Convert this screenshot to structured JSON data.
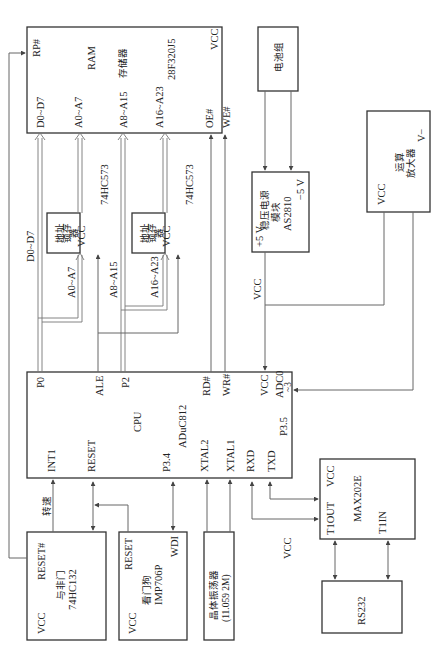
{
  "diagram": {
    "type": "block-diagram",
    "orientation": "rotated-90-ccw",
    "blocks": {
      "ram": {
        "pins": {
          "rp": "RP#",
          "d": "D0~D7",
          "a_lo": "A0~A7",
          "a_mid": "A8~A15",
          "a_hi": "A16~A23",
          "oe": "OE#",
          "we": "WE#",
          "vcc": "VCC"
        },
        "title": "RAM",
        "subtitle": "存储器",
        "part": "28F320J5"
      },
      "battery": {
        "title": "电池组"
      },
      "regulator": {
        "line1": "稳压电源",
        "line2": "模块",
        "part": "AS2810",
        "pos": "+5 V",
        "neg": "−5 V"
      },
      "opamp": {
        "line1": "运算",
        "line2": "放大器",
        "vcc": "VCC",
        "vminus": "V−"
      },
      "latch1": {
        "line1": "地址",
        "line2": "锁存",
        "line3": "器",
        "vcc": "VCC",
        "part": "74HC573"
      },
      "latch2": {
        "line1": "地址",
        "line2": "锁存",
        "line3": "器",
        "vcc": "VCC",
        "part": "74HC573"
      },
      "cpu": {
        "pins": {
          "p0": "P0",
          "ale": "ALE",
          "p2": "P2",
          "rd": "RD#",
          "wr": "WR#",
          "vcc": "VCC",
          "adc": "ADC0",
          "adc2": "~3",
          "p35": "P3.5",
          "int1": "INT1",
          "reset": "RESET",
          "p34": "P3.4",
          "xtal2": "XTAL2",
          "xtal1": "XTAL1",
          "rxd": "RXD",
          "txd": "TXD"
        },
        "title": "CPU",
        "part": "ADuC812"
      },
      "nand": {
        "reset": "RESET#",
        "line1": "与非门",
        "part": "74HC132",
        "vcc": "VCC"
      },
      "watchdog": {
        "reset": "RESET",
        "wdi": "WDI",
        "line1": "看门狗",
        "part": "IMP706P",
        "vcc": "VCC"
      },
      "crystal": {
        "line1": "晶体振荡器",
        "line2": "(11.059 2M)"
      },
      "max202": {
        "vcc": "VCC",
        "t1out": "T1OUT",
        "title": "MAX202E",
        "t1in": "T1IN"
      },
      "rs232": {
        "title": "RS232"
      }
    },
    "wire_labels": {
      "data_bus": "D0~D7",
      "a0a7": "A0~A7",
      "a8a15": "A8~A15",
      "a16a23": "A16~A23",
      "vcc_reg": "VCC",
      "speed": "转速",
      "vcc_free": "VCC"
    }
  }
}
